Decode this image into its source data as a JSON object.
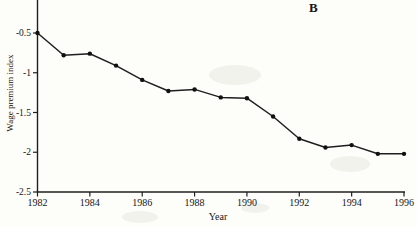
{
  "chart_data": {
    "type": "line",
    "title": "",
    "panel_label": "B",
    "xlabel": "Year",
    "ylabel": "Wage premium index",
    "x": [
      1982,
      1983,
      1984,
      1985,
      1986,
      1987,
      1988,
      1989,
      1990,
      1991,
      1992,
      1993,
      1994,
      1995,
      1996
    ],
    "series": [
      {
        "name": "Wage premium index",
        "values": [
          -0.5,
          -0.78,
          -0.76,
          -0.91,
          -1.09,
          -1.23,
          -1.21,
          -1.31,
          -1.32,
          -1.55,
          -1.83,
          -1.94,
          -1.91,
          -2.02,
          -2.02
        ]
      }
    ],
    "x_ticks": [
      "1982",
      "1984",
      "1986",
      "1988",
      "1990",
      "1992",
      "1994",
      "1996"
    ],
    "y_ticks": [
      {
        "label": "-0.5",
        "value": -0.5
      },
      {
        "label": "-1",
        "value": -1.0
      },
      {
        "label": "-1.5",
        "value": -1.5
      },
      {
        "label": "-2",
        "value": -2.0
      },
      {
        "label": "-2.5",
        "value": -2.5
      }
    ],
    "xlim": [
      1982,
      1996
    ],
    "ylim": [
      -2.5,
      -0.08
    ],
    "grid": false,
    "legend": "none",
    "marker": "filled-circle",
    "colors": {
      "line": "#1f1f1f",
      "marker": "#111111",
      "axis": "#1f1f1f",
      "text": "#161616",
      "background": "#fdfdfa"
    }
  }
}
